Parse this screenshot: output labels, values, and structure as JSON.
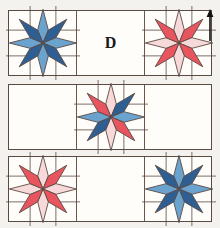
{
  "diagram": {
    "title_label": "D",
    "orientation_marker": "up-arrow",
    "background_color": "#f4f2ee",
    "block_fill_color": "#fffdfa",
    "outline_color": "#5a4a42",
    "inner_line_color": "#6b564c"
  },
  "palette": {
    "blue_dark": "#2f5f92",
    "blue_light": "#6ba3cf",
    "red_dark": "#e8555f",
    "red_light": "#f7d9d9",
    "outline": "#5a4a42",
    "white": "#fffdfa",
    "text": "#1a1a1a"
  },
  "legend": {
    "blue_star": "blue",
    "red_star": "red",
    "mixed_star": "red-blue"
  },
  "rows": [
    {
      "name": "row-1",
      "cells": [
        {
          "name": "cell-1-1",
          "content": "star",
          "star": "blue"
        },
        {
          "name": "cell-1-2",
          "content": "label",
          "label": "D"
        },
        {
          "name": "cell-1-3",
          "content": "star",
          "star": "red"
        }
      ]
    },
    {
      "name": "row-2",
      "cells": [
        {
          "name": "cell-2-1",
          "content": "empty",
          "label": ""
        },
        {
          "name": "cell-2-2",
          "content": "star",
          "star": "mixed"
        },
        {
          "name": "cell-2-3",
          "content": "empty",
          "label": ""
        }
      ]
    },
    {
      "name": "row-3",
      "cells": [
        {
          "name": "cell-3-1",
          "content": "star",
          "star": "red"
        },
        {
          "name": "cell-3-2",
          "content": "empty",
          "label": ""
        },
        {
          "name": "cell-3-3",
          "content": "star",
          "star": "blue"
        }
      ]
    }
  ],
  "stars": {
    "blue": {
      "name": "eight-point-star-blue",
      "points": [
        "blue_light",
        "blue_dark",
        "blue_light",
        "blue_dark",
        "blue_light",
        "blue_dark",
        "blue_light",
        "blue_dark"
      ]
    },
    "red": {
      "name": "eight-point-star-red",
      "points": [
        "red_light",
        "red_dark",
        "red_light",
        "red_dark",
        "red_light",
        "red_dark",
        "red_light",
        "red_dark"
      ]
    },
    "mixed": {
      "name": "eight-point-star-mixed",
      "points": [
        "red_light",
        "blue_dark",
        "blue_light",
        "red_dark",
        "red_light",
        "blue_dark",
        "blue_light",
        "red_dark"
      ]
    }
  },
  "geometry": {
    "rows_top": [
      10,
      84,
      156
    ],
    "row_height": 66,
    "row_left": 8,
    "row_width": 204,
    "cell_width": 68,
    "arrow_x": 205,
    "arrow_y": 8,
    "label_d_x": 95,
    "label_d_y": 33
  }
}
